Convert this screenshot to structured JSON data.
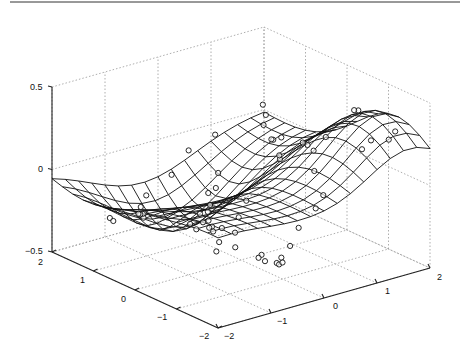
{
  "chart_data": {
    "type": "surface-mesh-3d",
    "title": "",
    "xlabel": "",
    "ylabel": "",
    "zlabel": "",
    "xlim": [
      -2,
      2
    ],
    "ylim": [
      -2,
      2
    ],
    "zlim": [
      -0.5,
      0.5
    ],
    "x_ticks": [
      "-2",
      "-1",
      "0",
      "1",
      "2"
    ],
    "y_ticks": [
      "-2",
      "-1",
      "0",
      "1",
      "2"
    ],
    "z_ticks": [
      "-0.5",
      "0",
      "0.5"
    ],
    "grid": "dotted",
    "mesh_resolution": 16,
    "surface_description": "Mesh surface fitted to scattered data: a peak (~0.35) near x≈0.5,y≈1.5 and a trough (~-0.4) near x≈-1,y≈-0.5, flat near zero elsewhere",
    "scatter_marker": "circle",
    "scatter_points": [
      [
        1.3,
        -1.9,
        0.33
      ],
      [
        1.5,
        -1.8,
        0.35
      ],
      [
        1.2,
        -1.6,
        0.3
      ],
      [
        1.9,
        -0.4,
        0.28
      ],
      [
        1.9,
        -0.3,
        0.27
      ],
      [
        1.8,
        1.7,
        0.02
      ],
      [
        1.9,
        1.9,
        0.05
      ],
      [
        1.6,
        1.5,
        0.0
      ],
      [
        1.7,
        1.2,
        -0.05
      ],
      [
        -1.8,
        -1.6,
        0.05
      ],
      [
        -1.6,
        -1.9,
        0.03
      ],
      [
        -1.9,
        -1.9,
        0.0
      ],
      [
        -1.7,
        -1.5,
        0.0
      ],
      [
        -1.9,
        -1.2,
        0.03
      ],
      [
        -1.5,
        -1.0,
        -0.02
      ],
      [
        -1.3,
        -1.2,
        -0.05
      ],
      [
        -1.4,
        -0.8,
        0.0
      ],
      [
        -1.1,
        -1.9,
        -0.15
      ],
      [
        -1.0,
        -1.7,
        -0.2
      ],
      [
        -0.8,
        -1.6,
        -0.25
      ],
      [
        -0.5,
        -1.5,
        -0.3
      ],
      [
        -0.3,
        -1.3,
        -0.35
      ],
      [
        -0.1,
        -1.1,
        -0.35
      ],
      [
        0.0,
        -1.0,
        -0.4
      ],
      [
        0.3,
        -0.8,
        -0.35
      ],
      [
        -1.0,
        -0.2,
        -0.2
      ],
      [
        -0.6,
        0.0,
        -0.25
      ],
      [
        -0.3,
        0.4,
        -0.28
      ],
      [
        0.0,
        0.8,
        -0.3
      ],
      [
        0.2,
        1.0,
        -0.3
      ],
      [
        0.4,
        1.3,
        -0.28
      ],
      [
        0.7,
        1.5,
        -0.3
      ],
      [
        0.9,
        1.7,
        -0.25
      ],
      [
        -0.5,
        -0.5,
        -0.32
      ],
      [
        -0.7,
        -0.3,
        -0.35
      ],
      [
        -0.2,
        -0.2,
        -0.2
      ],
      [
        0.1,
        0.0,
        -0.15
      ],
      [
        0.5,
        -0.3,
        0.1
      ],
      [
        0.8,
        0.1,
        0.05
      ],
      [
        1.0,
        0.5,
        0.08
      ],
      [
        1.2,
        0.8,
        0.03
      ],
      [
        0.6,
        -1.0,
        0.1
      ],
      [
        0.9,
        -0.6,
        0.15
      ],
      [
        1.1,
        -0.2,
        0.12
      ],
      [
        -1.5,
        0.5,
        -0.1
      ],
      [
        -1.2,
        0.8,
        -0.2
      ],
      [
        -0.9,
        1.2,
        -0.3
      ],
      [
        -0.6,
        1.6,
        -0.35
      ],
      [
        -0.3,
        1.9,
        -0.3
      ],
      [
        0.1,
        1.8,
        -0.2
      ],
      [
        0.5,
        1.9,
        -0.1
      ],
      [
        1.0,
        1.9,
        -0.05
      ],
      [
        -1.9,
        0.0,
        -0.05
      ],
      [
        -1.7,
        0.3,
        -0.1
      ],
      [
        -1.3,
        1.5,
        -0.3
      ],
      [
        -1.0,
        1.8,
        -0.38
      ],
      [
        0.3,
        -1.6,
        0.05
      ],
      [
        0.0,
        -1.8,
        0.02
      ],
      [
        -0.4,
        -1.9,
        -0.05
      ],
      [
        1.5,
        -1.0,
        0.15
      ],
      [
        1.6,
        0.0,
        0.1
      ],
      [
        1.4,
        0.3,
        0.05
      ]
    ]
  },
  "axes": {
    "z_tick_labels": [
      "0.5",
      "0",
      "−0.5"
    ],
    "left_tick_labels": [
      "2",
      "1",
      "0",
      "−1",
      "−2"
    ],
    "right_tick_labels": [
      "−2",
      "−1",
      "0",
      "1",
      "2"
    ]
  }
}
